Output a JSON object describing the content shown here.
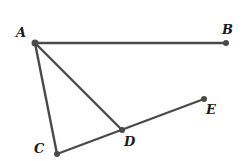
{
  "diagram": {
    "type": "geometry",
    "stroke_color": "#4a4a4a",
    "points": [
      {
        "id": "A",
        "label": "A",
        "x": 35,
        "y": 43,
        "lx": 16,
        "ly": 37
      },
      {
        "id": "B",
        "label": "B",
        "x": 226,
        "y": 43,
        "lx": 222,
        "ly": 34
      },
      {
        "id": "C",
        "label": "C",
        "x": 57,
        "y": 154,
        "lx": 34,
        "ly": 153
      },
      {
        "id": "D",
        "label": "D",
        "x": 122,
        "y": 130,
        "lx": 124,
        "ly": 146
      },
      {
        "id": "E",
        "label": "E",
        "x": 204,
        "y": 99,
        "lx": 206,
        "ly": 114
      }
    ],
    "segments": [
      {
        "from": "A",
        "to": "B"
      },
      {
        "from": "A",
        "to": "C"
      },
      {
        "from": "A",
        "to": "D"
      },
      {
        "from": "C",
        "to": "E"
      }
    ]
  }
}
